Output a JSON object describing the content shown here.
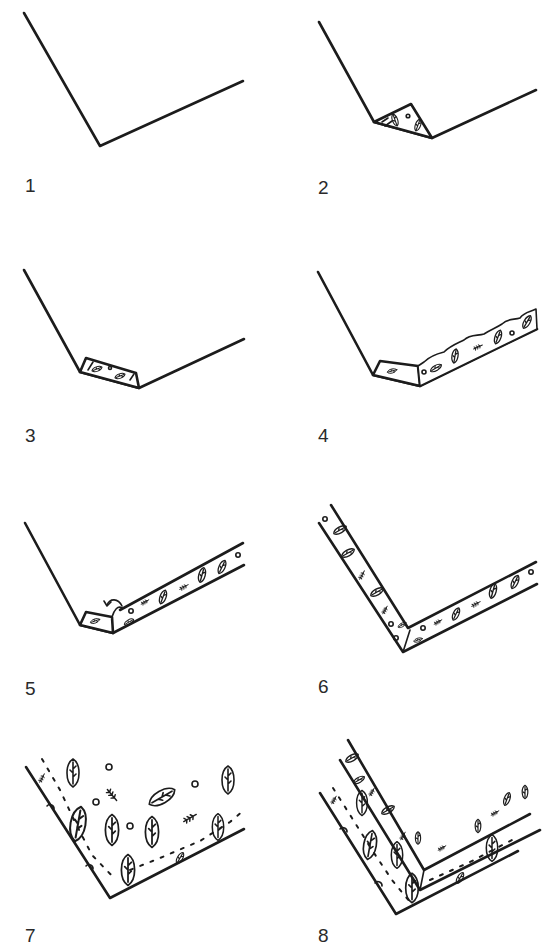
{
  "figure": {
    "title": "",
    "layout": "2 columns x 4 rows",
    "steps": [
      {
        "label": "1",
        "description": "plain V-shaped line"
      },
      {
        "label": "2",
        "description": "small triangular patterned fold at corner"
      },
      {
        "label": "3",
        "description": "patterned band along short segment at corner"
      },
      {
        "label": "4",
        "description": "rough-edged patterned strip along right arm"
      },
      {
        "label": "5",
        "description": "parallel patterned band along right arm with curl arrow at corner"
      },
      {
        "label": "6",
        "description": "both arms as parallel patterned bands"
      },
      {
        "label": "7",
        "description": "ground filled with scattered leaves, twigs, dots and dashed line"
      },
      {
        "label": "8",
        "description": "two stacked patterned bands with leaves and twigs"
      }
    ]
  },
  "colors": {
    "ink": "#1c1c1c",
    "background": "#ffffff",
    "label": "#2a2a2a"
  },
  "icons": {
    "leaf": "leaf-icon",
    "twig": "twig-icon",
    "dot": "dot-icon",
    "curl_arrow": "curl-arrow-icon"
  }
}
